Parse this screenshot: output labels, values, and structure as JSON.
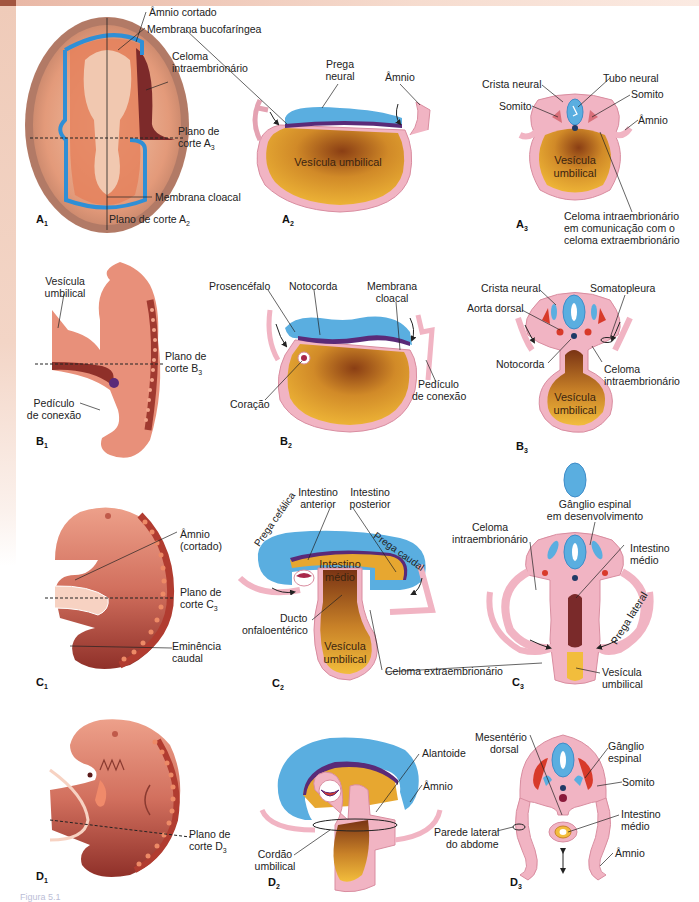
{
  "colors": {
    "ectoderm_blue": "#5aaee0",
    "mesoderm_pink": "#f1b4c3",
    "yolk_gold": "#e8a830",
    "yolk_brown": "#8b4513",
    "endoderm_purple": "#5a2a78",
    "embryo_skin": "#e8907a",
    "embryo_dark": "#9c3a32",
    "somite_red": "#d83a2a",
    "notochord": "#1f3a66"
  },
  "panels": {
    "A1": {
      "id": "A",
      "sub": "1",
      "labels": {
        "amnio": "Âmnio cortado",
        "membrana": "Membrana bucofaríngea",
        "celoma_1": "Celoma",
        "celoma_2": "intraembrionário",
        "plano_1": "Plano de",
        "plano_2": "corte A",
        "plano_sub": "3",
        "cloacal": "Membrana cloacal",
        "plano_a2": "Plano de corte A",
        "plano_a2_sub": "2"
      }
    },
    "A2": {
      "id": "A",
      "sub": "2",
      "labels": {
        "prega_1": "Prega",
        "prega_2": "neural",
        "amnio": "Âmnio",
        "vesicula": "Vesícula umbilical"
      }
    },
    "A3": {
      "id": "A",
      "sub": "3",
      "labels": {
        "crista": "Crista neural",
        "tubo": "Tubo neural",
        "somito_l": "Somito",
        "somito_r": "Somito",
        "amnio": "Âmnio",
        "vesicula_1": "Vesícula",
        "vesicula_2": "umbilical",
        "celoma_1": "Celoma intraembrionário",
        "celoma_2": "em comunicação com o",
        "celoma_3": "celoma extraembrionário"
      }
    },
    "B1": {
      "id": "B",
      "sub": "1",
      "labels": {
        "vesicula_1": "Vesícula",
        "vesicula_2": "umbilical",
        "plano_1": "Plano de",
        "plano_2": "corte B",
        "plano_sub": "3",
        "pediculo_1": "Pedículo",
        "pediculo_2": "de conexão"
      }
    },
    "B2": {
      "id": "B",
      "sub": "2",
      "labels": {
        "prosencefalo": "Prosencéfalo",
        "notocorda": "Notocorda",
        "membrana_1": "Membrana",
        "membrana_2": "cloacal",
        "coracao": "Coração",
        "pediculo_1": "Pedículo",
        "pediculo_2": "de conexão"
      }
    },
    "B3": {
      "id": "B",
      "sub": "3",
      "labels": {
        "crista": "Crista neural",
        "somatopleura": "Somatopleura",
        "aorta": "Aorta dorsal",
        "notocorda": "Notocorda",
        "celoma_1": "Celoma",
        "celoma_2": "intraembrionário",
        "vesicula_1": "Vesícula",
        "vesicula_2": "umbilical"
      }
    },
    "C1": {
      "id": "C",
      "sub": "1",
      "labels": {
        "amnio_1": "Âmnio",
        "amnio_2": "(cortado)",
        "plano_1": "Plano de",
        "plano_2": "corte C",
        "plano_sub": "3",
        "eminencia_1": "Eminência",
        "eminencia_2": "caudal"
      }
    },
    "C2": {
      "id": "C",
      "sub": "2",
      "labels": {
        "int_ant_1": "Intestino",
        "int_ant_2": "anterior",
        "int_post_1": "Intestino",
        "int_post_2": "posterior",
        "prega_cefalica": "Prega cefálica",
        "prega_caudal": "Prega caudal",
        "int_medio_1": "Intestino",
        "int_medio_2": "médio",
        "ducto_1": "Ducto",
        "ducto_2": "onfaloentérico",
        "vesicula_1": "Vesícula",
        "vesicula_2": "umbilical",
        "celoma_extra": "Celoma extraembrionário"
      }
    },
    "C3": {
      "id": "C",
      "sub": "3",
      "labels": {
        "ganglio_1": "Gânglio espinal",
        "ganglio_2": "em desenvolvimento",
        "celoma_1": "Celoma",
        "celoma_2": "intraembrionário",
        "int_medio_1": "Intestino",
        "int_medio_2": "médio",
        "prega_lateral": "Prega lateral",
        "vesicula_1": "Vesícula",
        "vesicula_2": "umbilical"
      }
    },
    "D1": {
      "id": "D",
      "sub": "1",
      "labels": {
        "plano_1": "Plano de",
        "plano_2": "corte D",
        "plano_sub": "3"
      }
    },
    "D2": {
      "id": "D",
      "sub": "2",
      "labels": {
        "alantoide": "Alantoide",
        "amnio": "Âmnio",
        "cordao_1": "Cordão",
        "cordao_2": "umbilical"
      }
    },
    "D3": {
      "id": "D",
      "sub": "3",
      "labels": {
        "mesenterio_1": "Mesentério",
        "mesenterio_2": "dorsal",
        "ganglio_1": "Gânglio",
        "ganglio_2": "espinal",
        "somito": "Somito",
        "parede_1": "Parede lateral",
        "parede_2": "do abdome",
        "int_medio_1": "Intestino",
        "int_medio_2": "médio",
        "amnio": "Âmnio"
      }
    }
  },
  "caption": "Figura 5.1"
}
